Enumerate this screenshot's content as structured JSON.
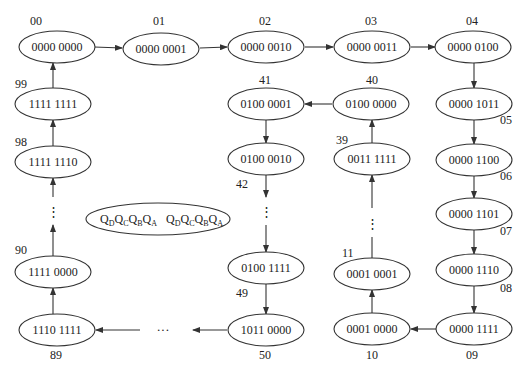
{
  "diagram": {
    "type": "state-transition",
    "nodes": [
      {
        "id": "00",
        "state": "0000 0000",
        "cx": 57,
        "cy": 47,
        "lx": 30,
        "ly": 25
      },
      {
        "id": "01",
        "state": "0000 0001",
        "cx": 161,
        "cy": 49,
        "lx": 153,
        "ly": 25
      },
      {
        "id": "02",
        "state": "0000 0010",
        "cx": 266,
        "cy": 47,
        "lx": 259,
        "ly": 25
      },
      {
        "id": "03",
        "state": "0000 0011",
        "cx": 372,
        "cy": 47,
        "lx": 365,
        "ly": 25
      },
      {
        "id": "04",
        "state": "0000 0100",
        "cx": 473,
        "cy": 47,
        "lx": 466,
        "ly": 25
      },
      {
        "id": "05",
        "state": "0000 1011",
        "cx": 474,
        "cy": 104,
        "lx": 500,
        "ly": 124
      },
      {
        "id": "06",
        "state": "0000 1100",
        "cx": 474,
        "cy": 160,
        "lx": 500,
        "ly": 180
      },
      {
        "id": "07",
        "state": "0000 1101",
        "cx": 474,
        "cy": 214,
        "lx": 500,
        "ly": 235
      },
      {
        "id": "08",
        "state": "0000 1110",
        "cx": 474,
        "cy": 270,
        "lx": 500,
        "ly": 292
      },
      {
        "id": "09",
        "state": "0000 1111",
        "cx": 474,
        "cy": 329,
        "lx": 466,
        "ly": 359
      },
      {
        "id": "10",
        "state": "0001 0000",
        "cx": 372,
        "cy": 329,
        "lx": 366,
        "ly": 359
      },
      {
        "id": "11",
        "state": "0001 0001",
        "cx": 372,
        "cy": 274,
        "lx": 342,
        "ly": 257
      },
      {
        "id": "39",
        "state": "0011 1111",
        "cx": 372,
        "cy": 159,
        "lx": 336,
        "ly": 144
      },
      {
        "id": "40",
        "state": "0100 0000",
        "cx": 371,
        "cy": 104,
        "lx": 366,
        "ly": 84
      },
      {
        "id": "41",
        "state": "0100 0001",
        "cx": 266,
        "cy": 104,
        "lx": 259,
        "ly": 84
      },
      {
        "id": "42",
        "state": "0100 0010",
        "cx": 266,
        "cy": 159,
        "lx": 236,
        "ly": 188
      },
      {
        "id": "49",
        "state": "0100 1111",
        "cx": 266,
        "cy": 268,
        "lx": 236,
        "ly": 297
      },
      {
        "id": "50",
        "state": "1011 0000",
        "cx": 266,
        "cy": 330,
        "lx": 259,
        "ly": 359
      },
      {
        "id": "89",
        "state": "1110 1111",
        "cx": 57,
        "cy": 330,
        "lx": 50,
        "ly": 359
      },
      {
        "id": "90",
        "state": "1111 0000",
        "cx": 53,
        "cy": 272,
        "lx": 15,
        "ly": 254
      },
      {
        "id": "98",
        "state": "1111 1110",
        "cx": 53,
        "cy": 162,
        "lx": 15,
        "ly": 146
      },
      {
        "id": "99",
        "state": "1111 1111",
        "cx": 53,
        "cy": 104,
        "lx": 15,
        "ly": 88
      }
    ],
    "ellipsis_vertical": "⋮",
    "ellipsis_horizontal": "···",
    "legend": {
      "text1_main": [
        "Q",
        "Q",
        "Q",
        "Q"
      ],
      "text1_sub": [
        "D",
        "C",
        "B",
        "A"
      ],
      "label": "QDQCQBQA QDQCQBQA"
    }
  }
}
